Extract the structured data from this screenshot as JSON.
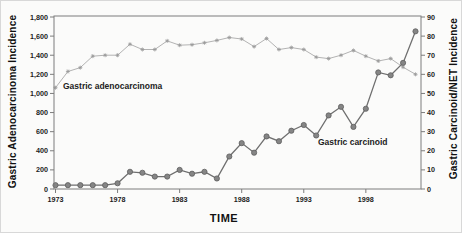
{
  "figure": {
    "background": "#fbfbfa"
  },
  "chart_data": {
    "type": "line",
    "title": "",
    "xlabel": "TIME",
    "x_tick_labels": [
      "1973",
      "1978",
      "1983",
      "1988",
      "1993",
      "1998"
    ],
    "x_range": [
      1973,
      2002
    ],
    "grid": "off",
    "frame_color": "#7c7c7c",
    "left_axis": {
      "title": "Gastric Adenocarcinoma Incidence",
      "min": 0,
      "max": 1800,
      "tick_step": 200,
      "tick_labels": [
        "0",
        "200",
        "400",
        "600",
        "800",
        "1,000",
        "1,200",
        "1,400",
        "1,600",
        "1,800"
      ]
    },
    "right_axis": {
      "title": "Gastric Carcinoid/NET Incidence",
      "min": 0,
      "max": 90,
      "tick_step": 10,
      "tick_labels": [
        "0",
        "10",
        "20",
        "30",
        "40",
        "50",
        "60",
        "70",
        "80",
        "90"
      ]
    },
    "x_years": [
      1973,
      1974,
      1975,
      1976,
      1977,
      1978,
      1979,
      1980,
      1981,
      1982,
      1983,
      1984,
      1985,
      1986,
      1987,
      1988,
      1989,
      1990,
      1991,
      1992,
      1993,
      1994,
      1995,
      1996,
      1997,
      1998,
      1999,
      2000,
      2001,
      2002
    ],
    "series": [
      {
        "name": "Gastric adenocarcinoma",
        "axis": "left",
        "marker": "asterisk",
        "line_color": "#b3b3b3",
        "marker_color": "#999999",
        "values": [
          1060,
          1230,
          1270,
          1390,
          1400,
          1400,
          1515,
          1460,
          1460,
          1550,
          1505,
          1510,
          1530,
          1555,
          1585,
          1570,
          1490,
          1575,
          1460,
          1480,
          1460,
          1380,
          1365,
          1400,
          1450,
          1390,
          1340,
          1365,
          1275,
          1200
        ]
      },
      {
        "name": "Gastric carcinoid",
        "axis": "right",
        "marker": "circle",
        "line_color": "#6f6f6f",
        "marker_color": "#858585",
        "values": [
          2,
          2,
          2,
          2,
          2,
          3,
          9,
          8.5,
          6.5,
          6.5,
          10,
          8,
          9,
          5.5,
          17,
          24,
          19,
          27.5,
          25,
          30.5,
          33.5,
          28,
          38.5,
          43,
          32.5,
          42,
          61,
          59.5,
          66,
          82.5
        ]
      }
    ],
    "annotations": [
      {
        "text": "Gastric adenocarcinoma"
      },
      {
        "text": "Gastric carcinoid"
      }
    ]
  }
}
